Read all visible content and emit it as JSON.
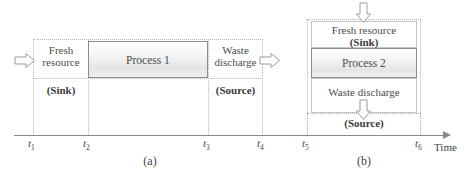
{
  "figure": {
    "title": "",
    "axis_label": "Time",
    "captions": {
      "panel_a": "(a)",
      "panel_b": "(b)"
    },
    "colors": {
      "axis": "#8a8a8a",
      "dotted_boundary": "#b9b9bd",
      "process_border": "#8d8d8d",
      "process_fill": "#eeeeee",
      "text": "#4c4c4c"
    }
  },
  "panel_a": {
    "caption": "(a)",
    "ticks": [
      {
        "id": "t1",
        "label": "t",
        "sub": "1"
      },
      {
        "id": "t2",
        "label": "t",
        "sub": "2"
      },
      {
        "id": "t3",
        "label": "t",
        "sub": "3"
      },
      {
        "id": "t4",
        "label": "t",
        "sub": "4"
      }
    ],
    "segments": {
      "fresh_resource": {
        "line1": "Fresh",
        "line2": "resource",
        "role": "(Sink)"
      },
      "process": {
        "label": "Process 1"
      },
      "waste_discharge": {
        "line1": "Waste",
        "line2": "discharge",
        "role": "(Source)"
      }
    },
    "arrows": {
      "inlet": {
        "direction": "right",
        "name": "fresh-resource-inlet"
      },
      "outlet": {
        "direction": "right",
        "name": "waste-discharge-outlet"
      }
    }
  },
  "panel_b": {
    "caption": "(b)",
    "ticks": [
      {
        "id": "t5",
        "label": "t",
        "sub": "5"
      },
      {
        "id": "t6",
        "label": "t",
        "sub": "6"
      }
    ],
    "segments": {
      "fresh_resource": {
        "label": "Fresh resource",
        "role": "(Sink)"
      },
      "process": {
        "label": "Process 2"
      },
      "waste_discharge": {
        "label": "Waste discharge",
        "role": "(Source)"
      }
    },
    "arrows": {
      "inlet": {
        "direction": "down",
        "name": "fresh-resource-inlet"
      },
      "outlet": {
        "direction": "down",
        "name": "waste-discharge-outlet"
      }
    }
  }
}
